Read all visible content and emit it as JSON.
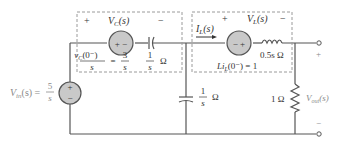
{
  "diagram": {
    "type": "s-domain circuit",
    "colors": {
      "wire": "#555555",
      "source_fill": "#c9c9c9",
      "dashed_box": "#9a9a9a",
      "text": "#333333",
      "faint_text": "#8a8a8a"
    },
    "source": {
      "label": "V",
      "sub": "in",
      "arg": "(s) =",
      "num": "5",
      "den": "s",
      "plus": "+",
      "minus": "−"
    },
    "cap_box": {
      "plus": "+",
      "minus": "−",
      "vlabel": "V",
      "vsub": "C",
      "varg": "(s)",
      "src_sign": "+ −",
      "init_num": "v",
      "init_sub": "C",
      "init_arg": "(0⁻)",
      "init_den": "s",
      "eq": "=",
      "val_num": "3",
      "val_den": "s",
      "imp_num": "1",
      "imp_den": "s",
      "imp_unit": "Ω"
    },
    "shunt_cap": {
      "num": "1",
      "den": "s",
      "unit": "Ω"
    },
    "ind_box": {
      "current": "I",
      "current_sub": "L",
      "current_arg": "(s)",
      "plus": "+",
      "minus": "−",
      "vlabel": "V",
      "vsub": "L",
      "varg": "(s)",
      "src_sign": "− +",
      "imp": "0.5s Ω",
      "init": "Li",
      "init_sub": "L",
      "init_arg": "(0⁻) = 1"
    },
    "resistor": {
      "label": "1 Ω"
    },
    "output": {
      "label": "V",
      "sub": "out",
      "arg": "(s)",
      "plus": "+",
      "minus": "−"
    }
  }
}
